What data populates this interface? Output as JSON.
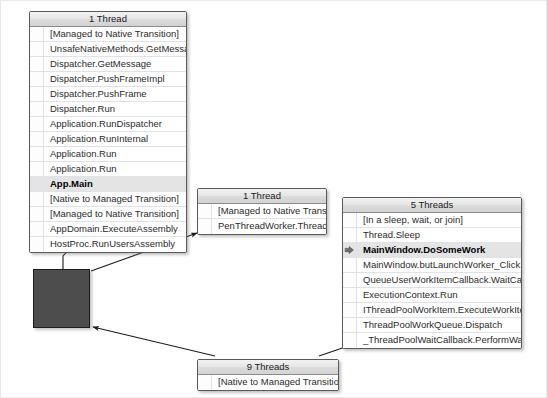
{
  "view": {
    "title": "Parallel Stacks",
    "background_color": "#ffffff",
    "node_fill_color": "#4d4d4d",
    "header_color": "#e6e6e6",
    "current_frame_highlight": "#e4e4e4"
  },
  "nodes": [
    {
      "id": "main-thread",
      "header": "1 Thread",
      "frames": [
        {
          "text": "[Managed to Native Transition]",
          "current": false,
          "marker": false
        },
        {
          "text": "UnsafeNativeMethods.GetMessageW",
          "current": false,
          "marker": false
        },
        {
          "text": "Dispatcher.GetMessage",
          "current": false,
          "marker": false
        },
        {
          "text": "Dispatcher.PushFrameImpl",
          "current": false,
          "marker": false
        },
        {
          "text": "Dispatcher.PushFrame",
          "current": false,
          "marker": false
        },
        {
          "text": "Dispatcher.Run",
          "current": false,
          "marker": false
        },
        {
          "text": "Application.RunDispatcher",
          "current": false,
          "marker": false
        },
        {
          "text": "Application.RunInternal",
          "current": false,
          "marker": false
        },
        {
          "text": "Application.Run",
          "current": false,
          "marker": false
        },
        {
          "text": "Application.Run",
          "current": false,
          "marker": false
        },
        {
          "text": "App.Main",
          "current": true,
          "marker": false
        },
        {
          "text": "[Native to Managed Transition]",
          "current": false,
          "marker": false
        },
        {
          "text": "[Managed to Native Transition]",
          "current": false,
          "marker": false
        },
        {
          "text": "AppDomain.ExecuteAssembly",
          "current": false,
          "marker": false
        },
        {
          "text": "HostProc.RunUsersAssembly",
          "current": false,
          "marker": false
        }
      ]
    },
    {
      "id": "pen-thread",
      "header": "1 Thread",
      "frames": [
        {
          "text": "[Managed to Native Transition]",
          "current": false,
          "marker": false
        },
        {
          "text": "PenThreadWorker.ThreadProc",
          "current": false,
          "marker": false
        }
      ]
    },
    {
      "id": "worker-threads",
      "header": "5 Threads",
      "frames": [
        {
          "text": "[In a sleep, wait, or join]",
          "current": false,
          "marker": false
        },
        {
          "text": "Thread.Sleep",
          "current": false,
          "marker": false
        },
        {
          "text": "MainWindow.DoSomeWork",
          "current": true,
          "marker": true
        },
        {
          "text": "MainWindow.butLaunchWorker_Click.Anony...",
          "current": false,
          "marker": false
        },
        {
          "text": "QueueUserWorkItemCallback.WaitCallback_...",
          "current": false,
          "marker": false
        },
        {
          "text": "ExecutionContext.Run",
          "current": false,
          "marker": false
        },
        {
          "text": "IThreadPoolWorkItem.ExecuteWorkItem",
          "current": false,
          "marker": false
        },
        {
          "text": "ThreadPoolWorkQueue.Dispatch",
          "current": false,
          "marker": false
        },
        {
          "text": "_ThreadPoolWaitCallback.PerformWaitCallba...",
          "current": false,
          "marker": false
        }
      ]
    },
    {
      "id": "native-threads",
      "header": "9 Threads",
      "frames": [
        {
          "text": "[Native to Managed Transition]",
          "current": false,
          "marker": false
        }
      ]
    }
  ],
  "collapsed_node": {
    "id": "collapsed-node",
    "label": ""
  },
  "edges": [
    {
      "from": "collapsed-node",
      "to": "main-thread"
    },
    {
      "from": "collapsed-node",
      "to": "pen-thread"
    },
    {
      "from": "native-threads",
      "to": "collapsed-node"
    },
    {
      "from": "native-threads",
      "to": "worker-threads"
    }
  ]
}
